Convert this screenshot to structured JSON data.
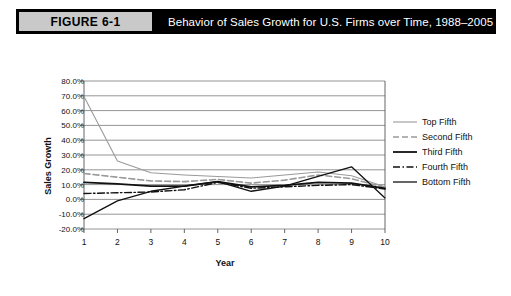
{
  "header": {
    "badge": "FIGURE 6-1",
    "title": "Behavior of Sales Growth for U.S. Firms over Time, 1988–2005"
  },
  "chart_data": {
    "type": "line",
    "title": "Behavior of Sales Growth for U.S. Firms over Time, 1988–2005",
    "xlabel": "Year",
    "ylabel": "Sales Growth",
    "x": [
      1,
      2,
      3,
      4,
      5,
      6,
      7,
      8,
      9,
      10
    ],
    "categories": [
      "1",
      "2",
      "3",
      "4",
      "5",
      "6",
      "7",
      "8",
      "9",
      "10"
    ],
    "xticklabels": [
      "1",
      "2",
      "3",
      "4",
      "5",
      "6",
      "7",
      "8",
      "9",
      "10"
    ],
    "yticklabels": [
      "80.0%",
      "70.0%",
      "60.0%",
      "50.0%",
      "40.0%",
      "30.0%",
      "20.0%",
      "10.0%",
      "0.0%",
      "-10.0%",
      "-20.0%"
    ],
    "ytickvalues": [
      80,
      70,
      60,
      50,
      40,
      30,
      20,
      10,
      0,
      -10,
      -20
    ],
    "ylim": [
      -20,
      80
    ],
    "xlim": [
      1,
      10
    ],
    "grid": "horizontal",
    "legend_position": "right",
    "series": [
      {
        "name": "Top Fifth",
        "values": [
          69.5,
          26.0,
          18.0,
          16.5,
          15.5,
          14.5,
          16.5,
          18.5,
          16.0,
          8.5
        ],
        "color": "#9a9a9a",
        "style": "solid",
        "width": 1.1
      },
      {
        "name": "Second Fifth",
        "values": [
          17.5,
          15.0,
          12.5,
          12.0,
          13.5,
          11.0,
          13.0,
          16.5,
          14.0,
          8.0
        ],
        "color": "#9a9a9a",
        "style": "dashed",
        "width": 1.6
      },
      {
        "name": "Third Fifth",
        "values": [
          11.5,
          10.5,
          9.0,
          9.0,
          12.0,
          8.5,
          9.5,
          11.5,
          11.0,
          7.5
        ],
        "color": "#111111",
        "style": "solid",
        "width": 1.8
      },
      {
        "name": "Fourth Fifth",
        "values": [
          4.0,
          4.5,
          5.0,
          6.5,
          11.5,
          7.5,
          8.5,
          9.5,
          10.0,
          7.0
        ],
        "color": "#111111",
        "style": "dashdot",
        "width": 1.4
      },
      {
        "name": "Bottom Fifth",
        "values": [
          -13.0,
          -1.0,
          5.5,
          9.0,
          12.0,
          5.5,
          9.0,
          15.5,
          22.0,
          1.0
        ],
        "color": "#111111",
        "style": "solid",
        "width": 1.3
      }
    ]
  }
}
